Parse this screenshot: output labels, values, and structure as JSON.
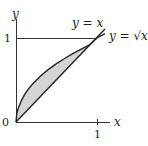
{
  "figure": {
    "axes": {
      "x_label": "x",
      "y_label": "y",
      "x_ticks": [
        "1"
      ],
      "y_ticks": [
        "1"
      ],
      "origin_label": "0"
    },
    "curves": [
      {
        "name": "line",
        "label": "y = x"
      },
      {
        "name": "sqrt",
        "label": "y = √x"
      }
    ],
    "region": {
      "description": "shaded region between y = √x and y = x for 0 ≤ x ≤ 1",
      "fill": "#d4d4d4"
    },
    "colors": {
      "stroke": "#222222",
      "shade": "#d4d4d4"
    }
  }
}
